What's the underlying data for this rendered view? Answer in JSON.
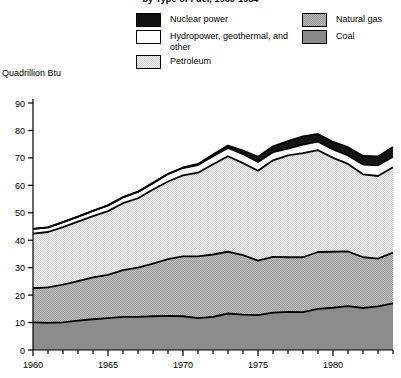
{
  "title": "by Type of Fuel, 1960-1984",
  "axis_title": "Quadrillion Btu",
  "legend": {
    "left": [
      {
        "key": "nuclear",
        "label": "Nuclear power",
        "swatch": "fill-nuclear"
      },
      {
        "key": "hydro",
        "label": "Hydropower, geothermal, and other",
        "swatch": "fill-hydro"
      },
      {
        "key": "petroleum",
        "label": "Petroleum",
        "swatch": "fill-petroleum"
      }
    ],
    "right": [
      {
        "key": "gas",
        "label": "Natural gas",
        "swatch": "fill-gas"
      },
      {
        "key": "coal",
        "label": "Coal",
        "swatch": "fill-coal"
      }
    ]
  },
  "chart_data": {
    "type": "area",
    "title": "by Type of Fuel, 1960-1984",
    "xlabel": "",
    "ylabel": "Quadrillion Btu",
    "ylim": [
      0,
      90
    ],
    "xlim": [
      1960,
      1984
    ],
    "ytick_labels": [
      "0",
      "10",
      "20",
      "30",
      "40",
      "50",
      "60",
      "70",
      "80",
      "90"
    ],
    "yticks": [
      0,
      10,
      20,
      30,
      40,
      50,
      60,
      70,
      80,
      90
    ],
    "xtick_labels": [
      "1960",
      "1965",
      "1970",
      "1975",
      "1980"
    ],
    "xticks": [
      1960,
      1965,
      1970,
      1975,
      1980
    ],
    "xtick_minor_step": 1,
    "grid": false,
    "legend_position": "top",
    "stacked": true,
    "stack_order_bottom_to_top": [
      "Coal",
      "Natural gas",
      "Petroleum",
      "Hydropower, geothermal, and other",
      "Nuclear power"
    ],
    "x": [
      1960,
      1961,
      1962,
      1963,
      1964,
      1965,
      1966,
      1967,
      1968,
      1969,
      1970,
      1971,
      1972,
      1973,
      1974,
      1975,
      1976,
      1977,
      1978,
      1979,
      1980,
      1981,
      1982,
      1983,
      1984
    ],
    "series": [
      {
        "name": "Coal",
        "values": [
          10.1,
          9.9,
          10.1,
          10.7,
          11.2,
          11.6,
          12.1,
          12.1,
          12.3,
          12.4,
          12.3,
          11.6,
          12.1,
          13.3,
          12.9,
          12.7,
          13.6,
          13.9,
          13.8,
          15.0,
          15.4,
          16.0,
          15.3,
          15.9,
          17.0
        ]
      },
      {
        "name": "Natural gas",
        "values": [
          12.4,
          12.9,
          13.7,
          14.4,
          15.3,
          15.8,
          17.0,
          17.9,
          19.2,
          20.7,
          21.8,
          22.5,
          22.7,
          22.5,
          21.7,
          19.9,
          20.3,
          19.9,
          20.0,
          20.7,
          20.4,
          19.9,
          18.5,
          17.4,
          18.5
        ]
      },
      {
        "name": "Petroleum",
        "values": [
          19.9,
          20.2,
          21.0,
          21.7,
          22.3,
          23.2,
          24.4,
          25.3,
          27.0,
          28.3,
          29.5,
          30.5,
          32.9,
          34.8,
          33.5,
          32.7,
          35.2,
          37.1,
          37.9,
          37.1,
          34.2,
          31.9,
          30.2,
          30.1,
          31.1
        ]
      },
      {
        "name": "Hydropower, geothermal, and other",
        "values": [
          1.7,
          1.7,
          1.8,
          1.8,
          1.9,
          2.1,
          2.1,
          2.3,
          2.3,
          2.7,
          2.7,
          2.8,
          2.9,
          3.0,
          3.3,
          3.2,
          3.0,
          2.5,
          3.1,
          3.1,
          3.1,
          3.1,
          3.6,
          3.9,
          3.8
        ]
      },
      {
        "name": "Nuclear power",
        "values": [
          0.0,
          0.0,
          0.0,
          0.0,
          0.0,
          0.0,
          0.1,
          0.1,
          0.1,
          0.1,
          0.2,
          0.4,
          0.6,
          0.9,
          1.3,
          1.9,
          2.1,
          2.7,
          3.0,
          2.8,
          2.7,
          3.0,
          3.1,
          3.2,
          3.6
        ]
      }
    ],
    "totals": [
      44.1,
      44.7,
      46.6,
      48.6,
      50.7,
      52.7,
      55.7,
      57.7,
      60.9,
      64.2,
      66.5,
      67.8,
      71.2,
      74.5,
      72.7,
      70.4,
      74.2,
      76.1,
      77.8,
      78.7,
      75.8,
      73.9,
      70.7,
      70.5,
      74.0
    ]
  }
}
